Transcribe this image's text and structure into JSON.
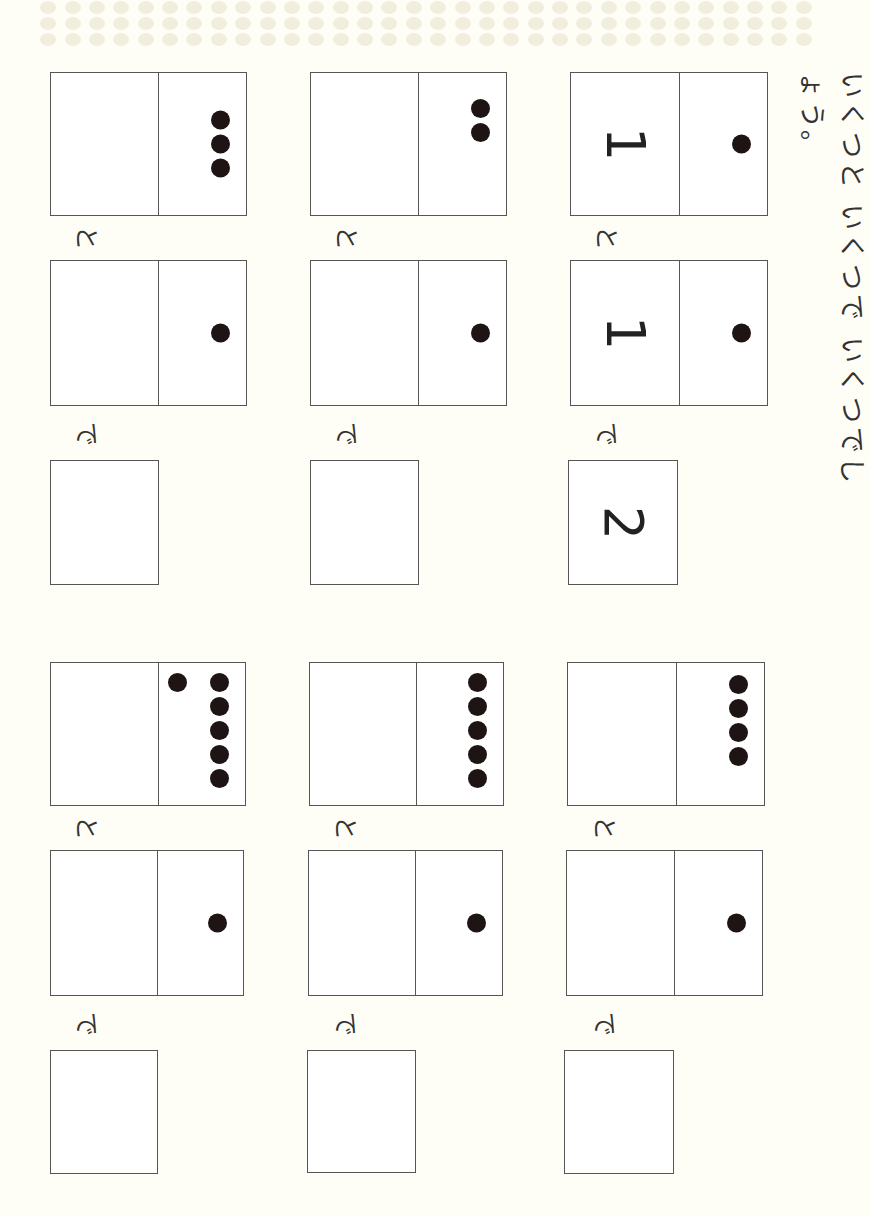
{
  "instruction": "いくつと いくつで いくつでしょう。",
  "labels": {
    "to": "と",
    "de": "で"
  },
  "colors": {
    "paper": "#fffef6",
    "dot": "#1e1414",
    "line": "#555555"
  },
  "problems": [
    {
      "id": "top-right",
      "box1": {
        "number": "1",
        "dots": 1
      },
      "box2": {
        "number": "1",
        "dots": 1
      },
      "answer": "2"
    },
    {
      "id": "top-middle",
      "box1": {
        "number": "",
        "dots": 2
      },
      "box2": {
        "number": "",
        "dots": 1
      },
      "answer": ""
    },
    {
      "id": "top-left",
      "box1": {
        "number": "",
        "dots": 3
      },
      "box2": {
        "number": "",
        "dots": 1
      },
      "answer": ""
    },
    {
      "id": "bottom-right",
      "box1": {
        "number": "",
        "dots": 4
      },
      "box2": {
        "number": "",
        "dots": 1
      },
      "answer": ""
    },
    {
      "id": "bottom-middle",
      "box1": {
        "number": "",
        "dots": 5
      },
      "box2": {
        "number": "",
        "dots": 1
      },
      "answer": ""
    },
    {
      "id": "bottom-left",
      "box1": {
        "number": "",
        "dots": 6,
        "dots_note": "5 in column + 1 extra"
      },
      "box2": {
        "number": "",
        "dots": 1
      },
      "answer": ""
    }
  ]
}
